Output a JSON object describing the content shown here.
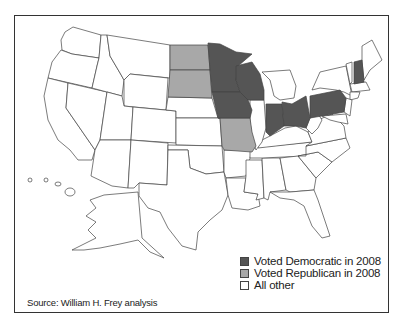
{
  "map": {
    "title": "US states by 2008 vote",
    "colors": {
      "democratic": "#555555",
      "republican": "#a8a8a8",
      "other": "#ffffff",
      "stroke": "#444444"
    },
    "states_democratic": [
      "Minnesota",
      "Wisconsin",
      "Iowa",
      "Indiana",
      "Ohio",
      "Pennsylvania",
      "New Hampshire"
    ],
    "states_republican": [
      "North Dakota",
      "South Dakota",
      "Missouri"
    ]
  },
  "legend": {
    "items": [
      {
        "label": "Voted Democratic in 2008",
        "color": "#555555"
      },
      {
        "label": "Voted Republican in 2008",
        "color": "#a8a8a8"
      },
      {
        "label": "All other",
        "color": "#ffffff"
      }
    ]
  },
  "source": "Source: William H. Frey analysis"
}
